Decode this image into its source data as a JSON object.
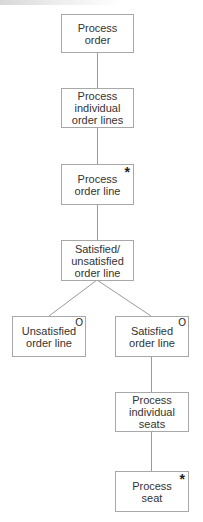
{
  "diagram": {
    "type": "jackson-structure-diagram",
    "colors": {
      "line": "#9a9a9a",
      "border": "#a8a8a8",
      "text": "#333333",
      "background": "#ffffff"
    },
    "nodes": [
      {
        "id": "process-order",
        "label": "Process\norder",
        "marker": ""
      },
      {
        "id": "process-individual-order-lines",
        "label": "Process\nindividual\norder lines",
        "marker": ""
      },
      {
        "id": "process-order-line",
        "label": "Process\norder line",
        "marker": "*"
      },
      {
        "id": "satisfied-unsatisfied-order-line",
        "label": "Satisfied/\nunsatisfied\norder line",
        "marker": ""
      },
      {
        "id": "unsatisfied-order-line",
        "label": "Unsatisfied\norder line",
        "marker": "O"
      },
      {
        "id": "satisfied-order-line",
        "label": "Satisfied\norder line",
        "marker": "O"
      },
      {
        "id": "process-individual-seats",
        "label": "Process\nindividual\nseats",
        "marker": ""
      },
      {
        "id": "process-seat",
        "label": "Process\nseat",
        "marker": "*"
      }
    ],
    "edges": [
      {
        "from": "process-order",
        "to": "process-individual-order-lines"
      },
      {
        "from": "process-individual-order-lines",
        "to": "process-order-line"
      },
      {
        "from": "process-order-line",
        "to": "satisfied-unsatisfied-order-line"
      },
      {
        "from": "satisfied-unsatisfied-order-line",
        "to": "unsatisfied-order-line"
      },
      {
        "from": "satisfied-unsatisfied-order-line",
        "to": "satisfied-order-line"
      },
      {
        "from": "satisfied-order-line",
        "to": "process-individual-seats"
      },
      {
        "from": "process-individual-seats",
        "to": "process-seat"
      }
    ]
  }
}
